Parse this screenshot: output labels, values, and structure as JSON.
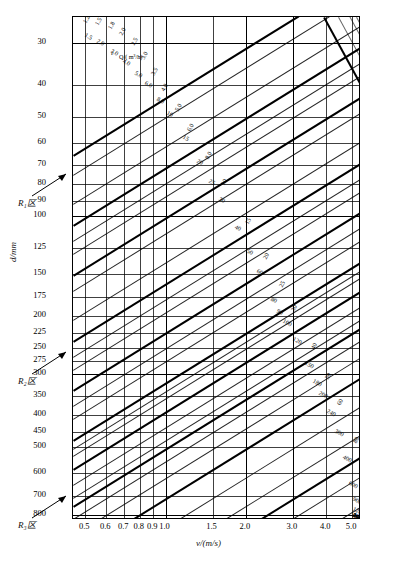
{
  "chart_data": {
    "type": "line",
    "title": "",
    "xlabel": "v/(m/s)",
    "ylabel": "d/mm",
    "xscale": "log",
    "yscale": "log",
    "xlim": [
      0.45,
      5.4
    ],
    "ylim": [
      25,
      830
    ],
    "grid": true,
    "legend": "none",
    "x_ticks": [
      "0.5",
      "0.6",
      "0.7",
      "0.8",
      "0.9",
      "1.0",
      "1.5",
      "2.0",
      "3.0",
      "4.0",
      "5.0"
    ],
    "y_ticks": [
      "30",
      "40",
      "50",
      "60",
      "70",
      "80",
      "90",
      "100",
      "125",
      "150",
      "175",
      "200",
      "225",
      "250",
      "275",
      "300",
      "350",
      "400",
      "450",
      "500",
      "600",
      "700",
      "800"
    ],
    "series_families": [
      {
        "name": "hydraulic-gradient-i",
        "unit": "i",
        "orientation": "descending-left-to-right",
        "values": [
          "1.2",
          "1.5",
          "1.8",
          "2.0",
          "2.5",
          "3.0",
          "3.5",
          "4.0",
          "5.0",
          "6.0",
          "8.0",
          "10",
          "15",
          "20",
          "25",
          "30",
          "40",
          "50",
          "60",
          "80",
          "100"
        ]
      },
      {
        "name": "flow-rate-Q",
        "unit": "L/s",
        "orientation": "ascending-left-to-right",
        "values": [
          "1.5",
          "2.0",
          "3.0",
          "4.0",
          "5.0",
          "6.0",
          "8.0",
          "10",
          "15",
          "20",
          "25",
          "30",
          "40",
          "50",
          "60",
          "80",
          "90",
          "100",
          "120",
          "150",
          "180",
          "200",
          "240",
          "300",
          "400",
          "600",
          "900",
          "1200",
          "1600",
          "2400",
          "3600",
          "4800",
          "6400",
          "9000"
        ]
      }
    ],
    "annotations": [
      {
        "text": "Q/( m³/h)",
        "role": "q-units-note"
      },
      {
        "text": "i",
        "role": "i-units-note"
      }
    ]
  },
  "axes": {
    "y_title": "d/mm",
    "x_title": "v/(m/s)"
  },
  "zone_labels": [
    {
      "id": "zone-1",
      "text": "R₁区"
    },
    {
      "id": "zone-2",
      "text": "R₂区"
    },
    {
      "id": "zone-3",
      "text": "R₃区"
    }
  ],
  "x_tick_labels": [
    "0.5",
    "0.6",
    "0.7",
    "0.8",
    "0.9",
    "1.0",
    "1.5",
    "2.0",
    "3.0",
    "4.0",
    "5.0"
  ],
  "y_tick_labels": [
    "30",
    "40",
    "50",
    "60",
    "70",
    "80",
    "90",
    "100",
    "125",
    "150",
    "175",
    "200",
    "225",
    "250",
    "275",
    "300",
    "350",
    "400",
    "450",
    "500",
    "600",
    "700",
    "800"
  ],
  "i_curve_labels": [
    "1.2",
    "1.5",
    "1.8",
    "2.0",
    "2.5",
    "3.0",
    "3.5",
    "4.0",
    "5.0",
    "6.0",
    "8.0",
    "10",
    "15",
    "20",
    "25",
    "30",
    "40",
    "50",
    "60",
    "80",
    "100"
  ],
  "q_curve_labels": [
    "1.5",
    "2.0",
    "3.0",
    "4.0",
    "5.0",
    "6.0",
    "8.0",
    "10",
    "15",
    "20",
    "25",
    "30",
    "40",
    "50",
    "60",
    "80",
    "90",
    "100",
    "120",
    "150",
    "180",
    "200",
    "240",
    "300",
    "400",
    "600",
    "900",
    "1200",
    "1600",
    "2400",
    "3600",
    "4800",
    "6400",
    "9000"
  ],
  "notes": {
    "q_unit_note": "Q/( m³/h)",
    "i_note": "i"
  }
}
